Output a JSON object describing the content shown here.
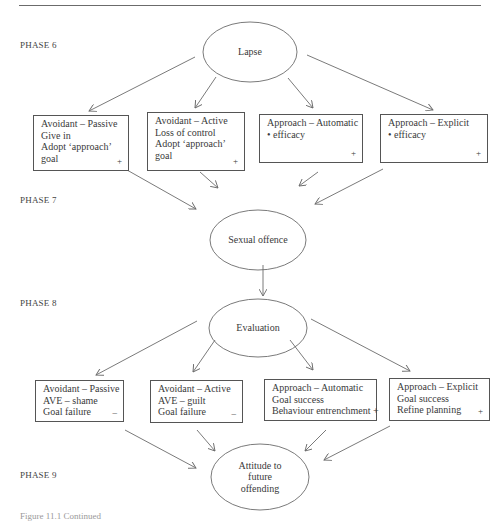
{
  "figure": {
    "phases": [
      {
        "label": "PHASE 6"
      },
      {
        "label": "PHASE 7"
      },
      {
        "label": "PHASE 8"
      },
      {
        "label": "PHASE 9"
      }
    ],
    "nodes": {
      "lapse": "Lapse",
      "sexual_offence": "Sexual offence",
      "evaluation": "Evaluation",
      "attitude": [
        "Attitude to",
        "future",
        "offending"
      ]
    },
    "phase6_boxes": [
      {
        "lines": [
          "Avoidant – Passive",
          "Give in",
          "Adopt ‘approach’",
          "goal"
        ],
        "sign": "+"
      },
      {
        "lines": [
          "Avoidant – Active",
          "Loss of control",
          "Adopt ‘approach’",
          "goal"
        ],
        "sign": "+"
      },
      {
        "lines": [
          "Approach – Automatic",
          "• efficacy"
        ],
        "sign": "+"
      },
      {
        "lines": [
          "Approach – Explicit",
          "• efficacy"
        ],
        "sign": "+"
      }
    ],
    "phase8_boxes": [
      {
        "lines": [
          "Avoidant – Passive",
          "AVE – shame",
          "Goal failure"
        ],
        "sign": "–"
      },
      {
        "lines": [
          "Avoidant – Active",
          "AVE – guilt",
          "Goal failure"
        ],
        "sign": "–"
      },
      {
        "lines": [
          "Approach – Automatic",
          "Goal success",
          "Behaviour entrenchment +"
        ],
        "sign": ""
      },
      {
        "lines": [
          "Approach – Explicit",
          "Goal success",
          "Refine planning"
        ],
        "sign": "+"
      }
    ],
    "caption": "Figure 11.1   Continued"
  },
  "colors": {
    "line": "#6b6b6b",
    "text": "#3a3a3a"
  }
}
